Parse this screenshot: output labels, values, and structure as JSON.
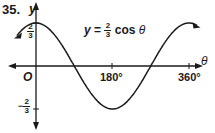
{
  "problem_number": "35.",
  "equation": {
    "lhs": "y",
    "eq": "=",
    "coef_num": "2",
    "coef_den": "3",
    "fn": "cos",
    "var": "θ"
  },
  "axes": {
    "x_label": "θ",
    "y_label": "y",
    "origin_label": "O"
  },
  "y_ticks": [
    {
      "sign": "",
      "num": "2",
      "den": "3"
    },
    {
      "sign": "−",
      "num": "2",
      "den": "3"
    }
  ],
  "x_ticks": [
    "180°",
    "360°"
  ],
  "chart_data": {
    "type": "line",
    "xlabel": "θ",
    "ylabel": "y",
    "x": [
      -45,
      0,
      45,
      90,
      135,
      180,
      225,
      270,
      315,
      360,
      380
    ],
    "series": [
      {
        "name": "y = 2/3 cos θ",
        "values": [
          0.471,
          0.667,
          0.471,
          0,
          -0.471,
          -0.667,
          -0.471,
          0,
          0.471,
          0.667,
          0.626
        ]
      }
    ],
    "xticks": [
      "180°",
      "360°"
    ],
    "yticks": [
      "2/3",
      "-2/3"
    ],
    "xlim": [
      -45,
      380
    ],
    "ylim": [
      -0.667,
      0.667
    ],
    "grid": false
  }
}
